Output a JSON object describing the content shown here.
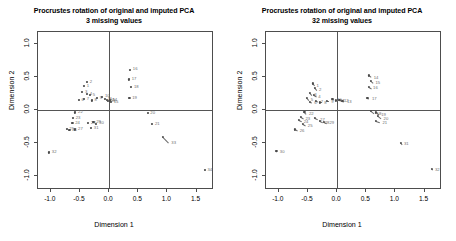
{
  "figure": {
    "width": 456,
    "height": 241,
    "background": "#ffffff",
    "point_color": "#4a4a4a",
    "axis_color": "#4d4d4d",
    "label_color": "#6e6e6e"
  },
  "panels": [
    {
      "id": "left",
      "title_line1": "Procrustes rotation of original and imputed PCA",
      "title_line2": "3 missing values",
      "xlabel": "Dimension 1",
      "ylabel": "Dimension 2",
      "xticks": [
        "-1.0",
        "-0.5",
        "0.0",
        "0.5",
        "1.0",
        "1.5"
      ],
      "xtickvals": [
        -1.0,
        -0.5,
        0.0,
        0.5,
        1.0,
        1.5
      ],
      "yticks": [
        "1.0",
        "0.5",
        "0.0",
        "-0.5",
        "-1.0"
      ],
      "ytickvals": [
        1.0,
        0.5,
        0.0,
        -0.5,
        -1.0
      ]
    },
    {
      "id": "right",
      "title_line1": "Procrustes rotation of original and imputed PCA",
      "title_line2": "32 missing values",
      "xlabel": "Dimension 1",
      "ylabel": "Dimension 2",
      "xticks": [
        "-1.0",
        "-0.5",
        "0.0",
        "0.5",
        "1.0",
        "1.5"
      ],
      "xtickvals": [
        -1.0,
        -0.5,
        0.0,
        0.5,
        1.0,
        1.5
      ],
      "yticks": [
        "1.0",
        "0.5",
        "0.0",
        "-0.5",
        "-1.0"
      ],
      "ytickvals": [
        1.0,
        0.5,
        0.0,
        -0.5,
        -1.0
      ]
    }
  ],
  "chart_data": [
    {
      "type": "scatter",
      "panel": "left",
      "title": "Procrustes rotation of original and imputed PCA\n3 missing values",
      "xlabel": "Dimension 1",
      "ylabel": "Dimension 2",
      "xlim": [
        -1.22,
        1.8
      ],
      "ylim": [
        -1.22,
        1.18
      ],
      "grid": false,
      "legend": "none",
      "zero_lines": true,
      "series": [
        {
          "name": "procrustes residuals",
          "points": [
            {
              "label": "1",
              "x": -0.43,
              "y": 0.36,
              "x2": -0.42,
              "y2": 0.37
            },
            {
              "label": "2",
              "x": -0.38,
              "y": 0.42,
              "x2": -0.37,
              "y2": 0.43
            },
            {
              "label": "3",
              "x": -0.46,
              "y": 0.27,
              "x2": -0.45,
              "y2": 0.28
            },
            {
              "label": "4",
              "x": -0.38,
              "y": 0.24,
              "x2": -0.37,
              "y2": 0.25
            },
            {
              "label": "5",
              "x": -0.33,
              "y": 0.22,
              "x2": -0.32,
              "y2": 0.23
            },
            {
              "label": "6",
              "x": -0.52,
              "y": 0.15,
              "x2": -0.51,
              "y2": 0.16
            },
            {
              "label": "7",
              "x": -0.43,
              "y": 0.16,
              "x2": -0.42,
              "y2": 0.17
            },
            {
              "label": "8",
              "x": -0.3,
              "y": 0.14,
              "x2": -0.29,
              "y2": 0.15
            },
            {
              "label": "9",
              "x": -0.21,
              "y": 0.18,
              "x2": -0.2,
              "y2": 0.19
            },
            {
              "label": "10",
              "x": -0.12,
              "y": 0.2,
              "x2": -0.11,
              "y2": 0.21
            },
            {
              "label": "11",
              "x": -0.07,
              "y": 0.16,
              "x2": -0.06,
              "y2": 0.17
            },
            {
              "label": "12",
              "x": -0.04,
              "y": 0.15,
              "x2": -0.03,
              "y2": 0.16
            },
            {
              "label": "13",
              "x": -0.02,
              "y": 0.13,
              "x2": -0.01,
              "y2": 0.14
            },
            {
              "label": "14",
              "x": 0.01,
              "y": 0.14,
              "x2": 0.02,
              "y2": 0.15
            },
            {
              "label": "15",
              "x": 0.03,
              "y": 0.12,
              "x2": 0.04,
              "y2": 0.13
            },
            {
              "label": "16",
              "x": 0.36,
              "y": 0.61,
              "x2": 0.37,
              "y2": 0.62
            },
            {
              "label": "17",
              "x": 0.34,
              "y": 0.46,
              "x2": 0.35,
              "y2": 0.47
            },
            {
              "label": "18",
              "x": 0.38,
              "y": 0.34,
              "x2": 0.39,
              "y2": 0.35
            },
            {
              "label": "19",
              "x": 0.35,
              "y": 0.18,
              "x2": 0.36,
              "y2": 0.19
            },
            {
              "label": "20",
              "x": 0.66,
              "y": -0.05,
              "x2": 0.67,
              "y2": -0.04
            },
            {
              "label": "21",
              "x": 0.74,
              "y": -0.22,
              "x2": 0.75,
              "y2": -0.21
            },
            {
              "label": "22",
              "x": -0.58,
              "y": -0.04,
              "x2": -0.57,
              "y2": -0.03
            },
            {
              "label": "23",
              "x": -0.62,
              "y": -0.13,
              "x2": -0.61,
              "y2": -0.12
            },
            {
              "label": "24",
              "x": -0.63,
              "y": -0.2,
              "x2": -0.62,
              "y2": -0.19
            },
            {
              "label": "25",
              "x": -0.73,
              "y": -0.29,
              "x2": -0.72,
              "y2": -0.28
            },
            {
              "label": "26",
              "x": -0.68,
              "y": -0.31,
              "x2": -0.67,
              "y2": -0.3
            },
            {
              "label": "27",
              "x": -0.58,
              "y": -0.3,
              "x2": -0.57,
              "y2": -0.29
            },
            {
              "label": "28",
              "x": -0.36,
              "y": -0.2,
              "x2": -0.35,
              "y2": -0.19
            },
            {
              "label": "29",
              "x": -0.27,
              "y": -0.19,
              "x2": -0.26,
              "y2": -0.18
            },
            {
              "label": "30",
              "x": -0.22,
              "y": -0.21,
              "x2": -0.21,
              "y2": -0.2
            },
            {
              "label": "31",
              "x": -0.31,
              "y": -0.28,
              "x2": -0.3,
              "y2": -0.27
            },
            {
              "label": "32",
              "x": -1.03,
              "y": -0.65,
              "x2": -1.02,
              "y2": -0.64
            },
            {
              "label": "33",
              "x": 0.93,
              "y": -0.41,
              "x2": 1.03,
              "y2": -0.5
            },
            {
              "label": "34",
              "x": 1.64,
              "y": -0.92,
              "x2": 1.65,
              "y2": -0.91
            }
          ]
        }
      ]
    },
    {
      "type": "scatter",
      "panel": "right",
      "title": "Procrustes rotation of original and imputed PCA\n32 missing values",
      "xlabel": "Dimension 1",
      "ylabel": "Dimension 2",
      "xlim": [
        -1.22,
        1.8
      ],
      "ylim": [
        -1.22,
        1.18
      ],
      "grid": false,
      "legend": "none",
      "zero_lines": true,
      "series": [
        {
          "name": "procrustes residuals",
          "points": [
            {
              "label": "1",
              "x": -0.42,
              "y": 0.4,
              "x2": -0.39,
              "y2": 0.36
            },
            {
              "label": "2",
              "x": -0.38,
              "y": 0.33,
              "x2": -0.35,
              "y2": 0.3
            },
            {
              "label": "3",
              "x": -0.46,
              "y": 0.26,
              "x2": -0.43,
              "y2": 0.23
            },
            {
              "label": "4",
              "x": -0.4,
              "y": 0.22,
              "x2": -0.36,
              "y2": 0.2
            },
            {
              "label": "5",
              "x": -0.52,
              "y": 0.18,
              "x2": -0.49,
              "y2": 0.15
            },
            {
              "label": "6",
              "x": -0.47,
              "y": 0.12,
              "x2": -0.43,
              "y2": 0.11
            },
            {
              "label": "7",
              "x": -0.36,
              "y": 0.13,
              "x2": -0.32,
              "y2": 0.12
            },
            {
              "label": "8",
              "x": -0.3,
              "y": 0.11,
              "x2": -0.26,
              "y2": 0.11
            },
            {
              "label": "9",
              "x": -0.18,
              "y": 0.13,
              "x2": -0.14,
              "y2": 0.13
            },
            {
              "label": "10",
              "x": -0.08,
              "y": 0.16,
              "x2": -0.04,
              "y2": 0.15
            },
            {
              "label": "11",
              "x": -0.02,
              "y": 0.14,
              "x2": 0.02,
              "y2": 0.14
            },
            {
              "label": "12",
              "x": 0.04,
              "y": 0.15,
              "x2": 0.08,
              "y2": 0.14
            },
            {
              "label": "13",
              "x": 0.09,
              "y": 0.13,
              "x2": 0.13,
              "y2": 0.12
            },
            {
              "label": "14",
              "x": 0.55,
              "y": 0.52,
              "x2": 0.59,
              "y2": 0.49
            },
            {
              "label": "15",
              "x": 0.58,
              "y": 0.44,
              "x2": 0.62,
              "y2": 0.41
            },
            {
              "label": "16",
              "x": 0.54,
              "y": 0.35,
              "x2": 0.58,
              "y2": 0.33
            },
            {
              "label": "17",
              "x": 0.52,
              "y": 0.18,
              "x2": 0.56,
              "y2": 0.17
            },
            {
              "label": "18",
              "x": 0.58,
              "y": -0.02,
              "x2": 0.64,
              "y2": -0.06
            },
            {
              "label": "19",
              "x": 0.66,
              "y": -0.04,
              "x2": 0.72,
              "y2": -0.08
            },
            {
              "label": "20",
              "x": 0.7,
              "y": -0.09,
              "x2": 0.76,
              "y2": -0.13
            },
            {
              "label": "21",
              "x": 0.67,
              "y": -0.17,
              "x2": 0.74,
              "y2": -0.19
            },
            {
              "label": "22",
              "x": -0.56,
              "y": -0.03,
              "x2": -0.52,
              "y2": -0.06
            },
            {
              "label": "23",
              "x": -0.62,
              "y": -0.11,
              "x2": -0.58,
              "y2": -0.13
            },
            {
              "label": "24",
              "x": -0.66,
              "y": -0.16,
              "x2": -0.61,
              "y2": -0.18
            },
            {
              "label": "25",
              "x": -0.58,
              "y": -0.22,
              "x2": -0.54,
              "y2": -0.24
            },
            {
              "label": "26",
              "x": -0.72,
              "y": -0.3,
              "x2": -0.68,
              "y2": -0.32
            },
            {
              "label": "27",
              "x": -0.38,
              "y": -0.13,
              "x2": -0.33,
              "y2": -0.15
            },
            {
              "label": "28",
              "x": -0.3,
              "y": -0.17,
              "x2": -0.25,
              "y2": -0.19
            },
            {
              "label": "29",
              "x": -0.22,
              "y": -0.18,
              "x2": -0.17,
              "y2": -0.2
            },
            {
              "label": "30",
              "x": -1.04,
              "y": -0.63,
              "x2": -1.02,
              "y2": -0.64
            },
            {
              "label": "31",
              "x": 1.09,
              "y": -0.5,
              "x2": 1.11,
              "y2": -0.52
            },
            {
              "label": "32",
              "x": 1.62,
              "y": -0.9,
              "x2": 1.64,
              "y2": -0.91
            }
          ]
        }
      ]
    }
  ]
}
